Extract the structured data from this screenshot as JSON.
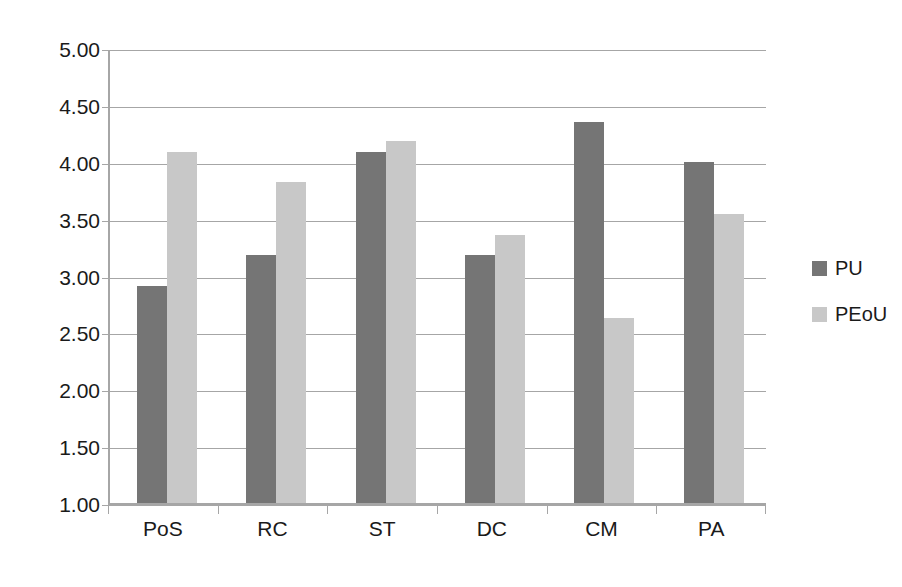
{
  "chart_data": {
    "type": "bar",
    "title": "",
    "subtitle": "",
    "xlabel": "",
    "ylabel": "",
    "categories": [
      "PoS",
      "RC",
      "ST",
      "DC",
      "CM",
      "PA"
    ],
    "series": [
      {
        "name": "PU",
        "color": "#757575",
        "values": [
          2.91,
          3.18,
          4.09,
          3.18,
          4.35,
          4.0
        ]
      },
      {
        "name": "PEoU",
        "color": "#c8c8c8",
        "values": [
          4.09,
          3.82,
          4.18,
          3.36,
          2.63,
          3.54
        ]
      }
    ],
    "ylim": [
      1.0,
      5.0
    ],
    "ytick_values": [
      5.0,
      4.5,
      4.0,
      3.5,
      3.0,
      2.5,
      2.0,
      1.5,
      1.0
    ],
    "ytick_labels": [
      "5.00",
      "4.50",
      "4.00",
      "3.50",
      "3.00",
      "2.50",
      "2.00",
      "1.50",
      "1.00"
    ],
    "grid": true,
    "grid_axis": "y",
    "legend_position": "right",
    "legend": [
      "PU",
      "PEoU"
    ],
    "bar_mode": "grouped",
    "background": "#ffffff",
    "axis_color": "#a6a6a6"
  }
}
